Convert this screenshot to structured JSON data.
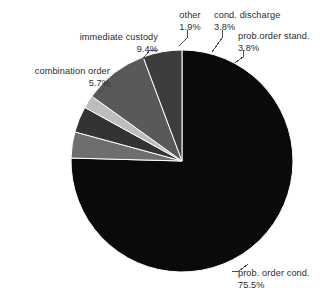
{
  "chart_data": {
    "type": "pie",
    "title": "",
    "subtitle": "",
    "legend_position": "callout-labels",
    "grid": false,
    "value_unit": "%",
    "categories": [
      "prob. order cond.",
      "prob.order stand.",
      "cond. discharge",
      "other",
      "immediate custody",
      "combination order"
    ],
    "values": [
      75.5,
      3.8,
      3.8,
      1.9,
      9.4,
      5.7
    ],
    "slices": [
      {
        "label": "prob. order cond.",
        "value": 75.5,
        "value_text": "75.5%",
        "color": "#0a0a0a",
        "start_angle": 110.5,
        "end_angle": 382.3
      },
      {
        "label": "prob.order stand.",
        "value": 3.8,
        "value_text": "3.8%",
        "color": "#6e6e6e",
        "start_angle": 396.9,
        "end_angle": 410.6
      },
      {
        "label": "cond. discharge",
        "value": 3.8,
        "value_text": "3.8%",
        "color": "#333333",
        "start_angle": 410.6,
        "end_angle": 424.3
      },
      {
        "label": "other",
        "value": 1.9,
        "value_text": "1.9%",
        "color": "#bdbdbd",
        "start_angle": 424.3,
        "end_angle": 431.1
      },
      {
        "label": "immediate custody",
        "value": 9.4,
        "value_text": "9.4%",
        "color": "#595959",
        "start_angle": 431.1,
        "end_angle": 464.9
      },
      {
        "label": "combination order",
        "value": 5.7,
        "value_text": "5.7%",
        "color": "#3d3d3d",
        "start_angle": 464.9,
        "end_angle": 485.4
      }
    ]
  },
  "labels": {
    "other": {
      "name": "other",
      "pct": "1.9%"
    },
    "cond_discharge": {
      "name": "cond. discharge",
      "pct": "3.8%"
    },
    "prob_order_stand": {
      "name": "prob.order stand.",
      "pct": "3.8%"
    },
    "immediate_custody": {
      "name": "immediate custody",
      "pct": "9.4%"
    },
    "combination_order": {
      "name": "combination order",
      "pct": "5.7%"
    },
    "prob_order_cond": {
      "name": "prob. order cond.",
      "pct": "75.5%"
    }
  },
  "colors": {
    "background": "#ffffff",
    "text": "#2b2b2b",
    "leader_line": "#4d4d4d",
    "slice_outline": "#ffffff"
  }
}
